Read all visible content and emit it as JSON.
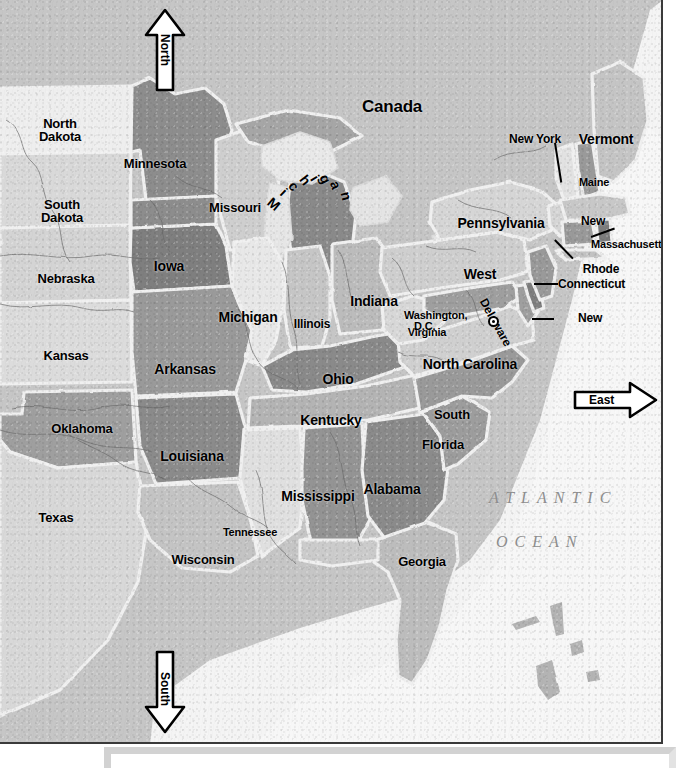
{
  "map": {
    "title": "Eastern United States Reference Map",
    "projection_note": "",
    "frame": {
      "width": 663,
      "height": 744
    }
  },
  "compass": {
    "north": {
      "label": "North",
      "direction": "up"
    },
    "south": {
      "label": "South",
      "direction": "down"
    },
    "east": {
      "label": "East",
      "direction": "right"
    }
  },
  "water_labels": [
    {
      "line1": "ATLANTIC",
      "line2": "OCEAN"
    }
  ],
  "country_labels": [
    {
      "name": "Canada"
    }
  ],
  "capital": {
    "name_line1": "Washington,",
    "name_line2": "D.C.",
    "marker": "capital-star-icon"
  },
  "states": [
    {
      "id": "north-dakota",
      "line1": "North",
      "line2": "Dakota"
    },
    {
      "id": "south-dakota",
      "line1": "South",
      "line2": "Dakota"
    },
    {
      "id": "nebraska",
      "line1": "Nebraska",
      "line2": ""
    },
    {
      "id": "kansas",
      "line1": "Kansas",
      "line2": ""
    },
    {
      "id": "oklahoma",
      "line1": "Oklahoma",
      "line2": ""
    },
    {
      "id": "texas",
      "line1": "Texas",
      "line2": ""
    },
    {
      "id": "minnesota",
      "line1": "Minnesota",
      "line2": ""
    },
    {
      "id": "iowa",
      "line1": "Iowa",
      "line2": ""
    },
    {
      "id": "missouri",
      "line1": "Missouri",
      "line2": ""
    },
    {
      "id": "arkansas",
      "line1": "Arkansas",
      "line2": ""
    },
    {
      "id": "louisiana",
      "line1": "Louisiana",
      "line2": ""
    },
    {
      "id": "wisconsin",
      "line1": "Wisconsin",
      "line2": ""
    },
    {
      "id": "michigan",
      "line1": "Michigan",
      "line2": ""
    },
    {
      "id": "illinois",
      "line1": "Illinois",
      "line2": ""
    },
    {
      "id": "indiana",
      "line1": "Indiana",
      "line2": ""
    },
    {
      "id": "ohio",
      "line1": "Ohio",
      "line2": ""
    },
    {
      "id": "kentucky",
      "line1": "Kentucky",
      "line2": ""
    },
    {
      "id": "tennessee",
      "line1": "Tennessee",
      "line2": ""
    },
    {
      "id": "mississippi",
      "line1": "Mississippi",
      "line2": ""
    },
    {
      "id": "alabama",
      "line1": "Alabama",
      "line2": ""
    },
    {
      "id": "georgia",
      "line1": "Georgia",
      "line2": ""
    },
    {
      "id": "florida",
      "line1": "Florida",
      "line2": ""
    },
    {
      "id": "south-carolina",
      "line1": "South",
      "line2": "Carolina"
    },
    {
      "id": "north-carolina",
      "line1": "North  Carolina",
      "line2": ""
    },
    {
      "id": "virginia",
      "line1": "Virginia",
      "line2": ""
    },
    {
      "id": "west-virginia",
      "line1": "West",
      "line2": "Virginia"
    },
    {
      "id": "pennsylvania",
      "line1": "Pennsylvania",
      "line2": ""
    },
    {
      "id": "new-york",
      "line1": "New  York",
      "line2": ""
    },
    {
      "id": "vermont",
      "line1": "Vermont",
      "line2": ""
    },
    {
      "id": "maine",
      "line1": "Maine",
      "line2": ""
    },
    {
      "id": "new-hampshire",
      "line1": "New",
      "line2": "Hampshire"
    },
    {
      "id": "massachusetts",
      "line1": "Massachusetts",
      "line2": ""
    },
    {
      "id": "rhode-island",
      "line1": "Rhode",
      "line2": "Island"
    },
    {
      "id": "connecticut",
      "line1": "Connecticut",
      "line2": ""
    },
    {
      "id": "new-jersey",
      "line1": "New",
      "line2": "Jersey"
    },
    {
      "id": "delaware",
      "line1": "Delaware",
      "line2": ""
    },
    {
      "id": "maryland",
      "line1": "Maryland",
      "line2": ""
    }
  ],
  "colors": {
    "map_background": "#c9c9c9",
    "ocean": "#f2f2f2",
    "border_line": "#3a3a3a",
    "label_text": "#000000",
    "ocean_label_text": "#8d8d8d",
    "panel_shadow": "#d2d2d2"
  }
}
